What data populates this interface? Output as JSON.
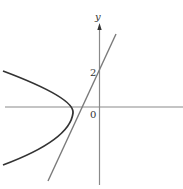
{
  "figure": {
    "labels": {
      "y_axis": "y",
      "y_intercept": "2",
      "origin": "0"
    },
    "colors": {
      "axis": "#8a8a8a",
      "parabola": "#333333",
      "line": "#7a7a7a",
      "text": "#333333"
    },
    "elements": [
      {
        "type": "axis",
        "name": "x-axis"
      },
      {
        "type": "axis",
        "name": "y-axis",
        "arrow": true
      },
      {
        "type": "curve",
        "name": "parabola",
        "description": "leftward-opening parabola with vertex left of origin, below x-axis"
      },
      {
        "type": "line",
        "name": "tangent-line",
        "description": "line with positive slope, y-intercept 2, tangent to parabola"
      }
    ]
  }
}
